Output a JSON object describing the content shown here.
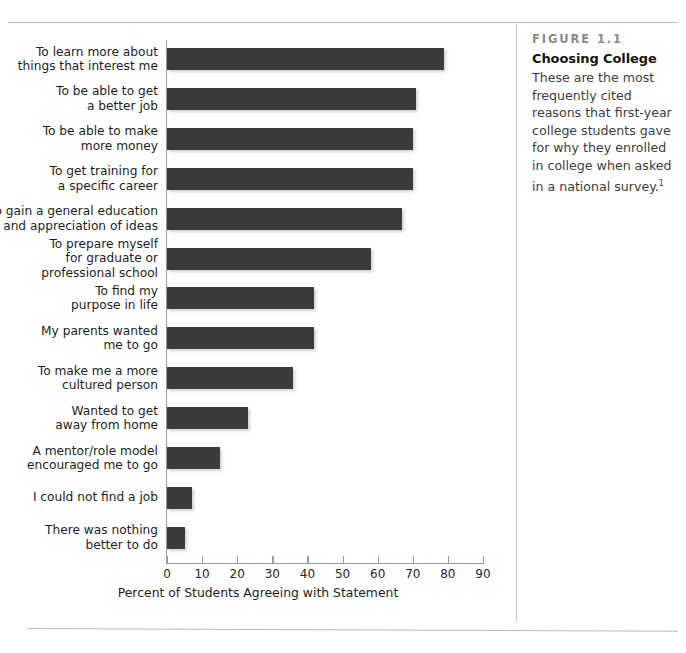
{
  "figure": {
    "number_label": "FIGURE 1.1",
    "title": "Choosing College",
    "description": "These are the most frequently cited reasons that first-year college students gave for why they enrolled in college when asked in a national survey.",
    "footnote_marker": "1"
  },
  "chart_data": {
    "type": "bar",
    "orientation": "horizontal",
    "title": "Choosing College",
    "xlabel": "Percent of Students Agreeing with Statement",
    "ylabel": "",
    "xlim": [
      0,
      90
    ],
    "xticks": [
      0,
      10,
      20,
      30,
      40,
      50,
      60,
      70,
      80,
      90
    ],
    "grid": false,
    "legend": false,
    "bar_color": "#3b3b3b",
    "categories": [
      "To learn more about\nthings that interest me",
      "To be able to get\na better job",
      "To be able to make\nmore money",
      "To get training for\na specific career",
      "To gain a general education\nand appreciation of ideas",
      "To prepare myself\nfor graduate or\nprofessional school",
      "To find my\npurpose in life",
      "My parents wanted\nme to go",
      "To make me a more\ncultured person",
      "Wanted to get\naway from home",
      "A mentor/role model\nencouraged me to go",
      "I could not find a job",
      "There was nothing\nbetter to do"
    ],
    "values": [
      79,
      71,
      70,
      70,
      67,
      58,
      42,
      42,
      36,
      23,
      15,
      7,
      5
    ]
  }
}
